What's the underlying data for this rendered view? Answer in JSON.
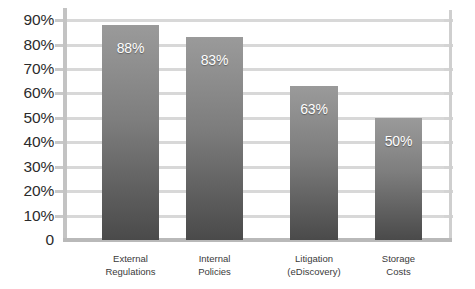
{
  "chart_data": {
    "type": "bar",
    "title": "",
    "subtitle": "",
    "xlabel": "",
    "ylabel": "",
    "categories": [
      "External Regulations",
      "Internal Policies",
      "Litigation (eDiscovery)",
      "Storage Costs"
    ],
    "category_lines": [
      [
        "External",
        "Regulations"
      ],
      [
        "Internal",
        "Policies"
      ],
      [
        "Litigation",
        "(eDiscovery)"
      ],
      [
        "Storage",
        "Costs"
      ]
    ],
    "values": [
      88,
      83,
      63,
      50
    ],
    "value_labels": [
      "88%",
      "83%",
      "63%",
      "50%"
    ],
    "ylim": [
      0,
      95
    ],
    "ytick_values": [
      90,
      80,
      70,
      60,
      50,
      40,
      30,
      20,
      10,
      0
    ],
    "ytick_labels": [
      "90%",
      "80%",
      "70%",
      "60%",
      "50%",
      "40%",
      "30%",
      "20%",
      "10%",
      "0"
    ],
    "grid": true,
    "legend": false,
    "legend_position": "none",
    "colors": {
      "bar_gradient_top": "#9a9a9a",
      "bar_gradient_bottom": "#4a4a4a",
      "gridline": "#d8d8d8",
      "axis_line": "#c3c3c3",
      "baseline": "#b9b9b9",
      "tick_label": "#2b2b2b",
      "category_label": "#3a3a3a",
      "value_label": "#ffffff",
      "background": "#ffffff"
    }
  }
}
